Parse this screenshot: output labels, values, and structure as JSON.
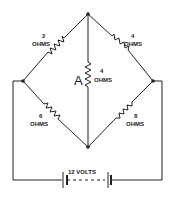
{
  "diagram": {
    "type": "wheatstone-bridge-circuit",
    "resistors": [
      {
        "id": "r1",
        "value": "2",
        "unit": "OHMS",
        "position": "top-left"
      },
      {
        "id": "r2",
        "value": "4",
        "unit": "OHMS",
        "position": "top-right"
      },
      {
        "id": "r3",
        "value": "4",
        "unit": "OHMS",
        "position": "center",
        "tag": "A"
      },
      {
        "id": "r4",
        "value": "6",
        "unit": "OHMS",
        "position": "bottom-left"
      },
      {
        "id": "r5",
        "value": "8",
        "unit": "OHMS",
        "position": "bottom-right"
      }
    ],
    "battery": {
      "label": "12 VOLTS"
    },
    "colors": {
      "ink": "#222222",
      "background": "#ffffff"
    }
  }
}
